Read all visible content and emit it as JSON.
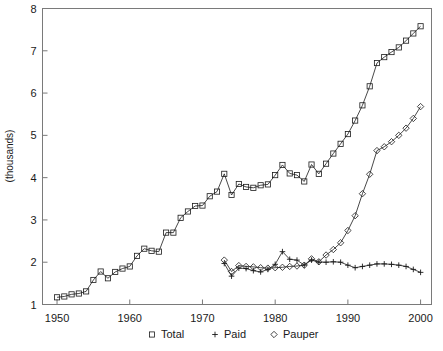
{
  "chart_data": {
    "type": "line",
    "title": "",
    "subtitle": "",
    "xlabel": "",
    "ylabel": "(thousands)",
    "xlim": [
      1948,
      2001.5
    ],
    "ylim": [
      1,
      8
    ],
    "xticks": [
      1950,
      1960,
      1970,
      1980,
      1990,
      2000
    ],
    "xtick_labels": [
      "1950",
      "1960",
      "1970",
      "1980",
      "1990",
      "2000"
    ],
    "yticks": [
      1,
      2,
      3,
      4,
      5,
      6,
      7,
      8
    ],
    "ytick_labels": [
      "1",
      "2",
      "3",
      "4",
      "5",
      "6",
      "7",
      "8"
    ],
    "grid": false,
    "legend_position": "bottom-center",
    "legend": [
      {
        "label": "Total",
        "marker": "square"
      },
      {
        "label": "Paid",
        "marker": "plus"
      },
      {
        "label": "Pauper",
        "marker": "diamond"
      }
    ],
    "series": [
      {
        "name": "Total",
        "marker": "square",
        "x": [
          1950,
          1951,
          1952,
          1953,
          1954,
          1955,
          1956,
          1957,
          1958,
          1959,
          1960,
          1961,
          1962,
          1963,
          1964,
          1965,
          1966,
          1967,
          1968,
          1969,
          1970,
          1971,
          1972,
          1973,
          1974,
          1975,
          1976,
          1977,
          1978,
          1979,
          1980,
          1981,
          1982,
          1983,
          1984,
          1985,
          1986,
          1987,
          1988,
          1989,
          1990,
          1991,
          1992,
          1993,
          1994,
          1995,
          1996,
          1997,
          1998,
          1999,
          2000
        ],
        "values": [
          1.17,
          1.19,
          1.24,
          1.26,
          1.31,
          1.58,
          1.78,
          1.62,
          1.77,
          1.85,
          1.9,
          2.15,
          2.32,
          2.27,
          2.25,
          2.7,
          2.7,
          3.05,
          3.2,
          3.33,
          3.34,
          3.56,
          3.67,
          4.09,
          3.59,
          3.85,
          3.78,
          3.76,
          3.82,
          3.84,
          4.06,
          4.3,
          4.1,
          4.06,
          3.91,
          4.31,
          4.09,
          4.33,
          4.57,
          4.8,
          5.03,
          5.35,
          5.71,
          6.16,
          6.71,
          6.85,
          6.97,
          7.08,
          7.24,
          7.41,
          7.58
        ]
      },
      {
        "name": "Paid",
        "marker": "plus",
        "x": [
          1973,
          1974,
          1975,
          1976,
          1977,
          1978,
          1979,
          1980,
          1981,
          1982,
          1983,
          1984,
          1985,
          1986,
          1987,
          1988,
          1989,
          1990,
          1991,
          1992,
          1993,
          1994,
          1995,
          1996,
          1997,
          1998,
          1999,
          2000
        ],
        "values": [
          1.97,
          1.67,
          1.86,
          1.85,
          1.8,
          1.77,
          1.83,
          1.95,
          2.25,
          2.07,
          2.05,
          1.93,
          2.05,
          2.0,
          2.0,
          2.01,
          2.0,
          1.93,
          1.87,
          1.9,
          1.93,
          1.96,
          1.96,
          1.95,
          1.93,
          1.9,
          1.83,
          1.76
        ]
      },
      {
        "name": "Pauper",
        "marker": "diamond",
        "x": [
          1973,
          1974,
          1975,
          1976,
          1977,
          1978,
          1979,
          1980,
          1981,
          1982,
          1983,
          1984,
          1985,
          1986,
          1987,
          1988,
          1989,
          1990,
          1991,
          1992,
          1993,
          1994,
          1995,
          1996,
          1997,
          1998,
          1999,
          2000
        ],
        "values": [
          2.05,
          1.78,
          1.92,
          1.9,
          1.89,
          1.87,
          1.86,
          1.87,
          1.88,
          1.9,
          1.91,
          1.93,
          2.08,
          2.01,
          2.17,
          2.3,
          2.46,
          2.75,
          3.1,
          3.62,
          4.08,
          4.64,
          4.73,
          4.85,
          5.0,
          5.17,
          5.4,
          5.68
        ]
      }
    ]
  }
}
